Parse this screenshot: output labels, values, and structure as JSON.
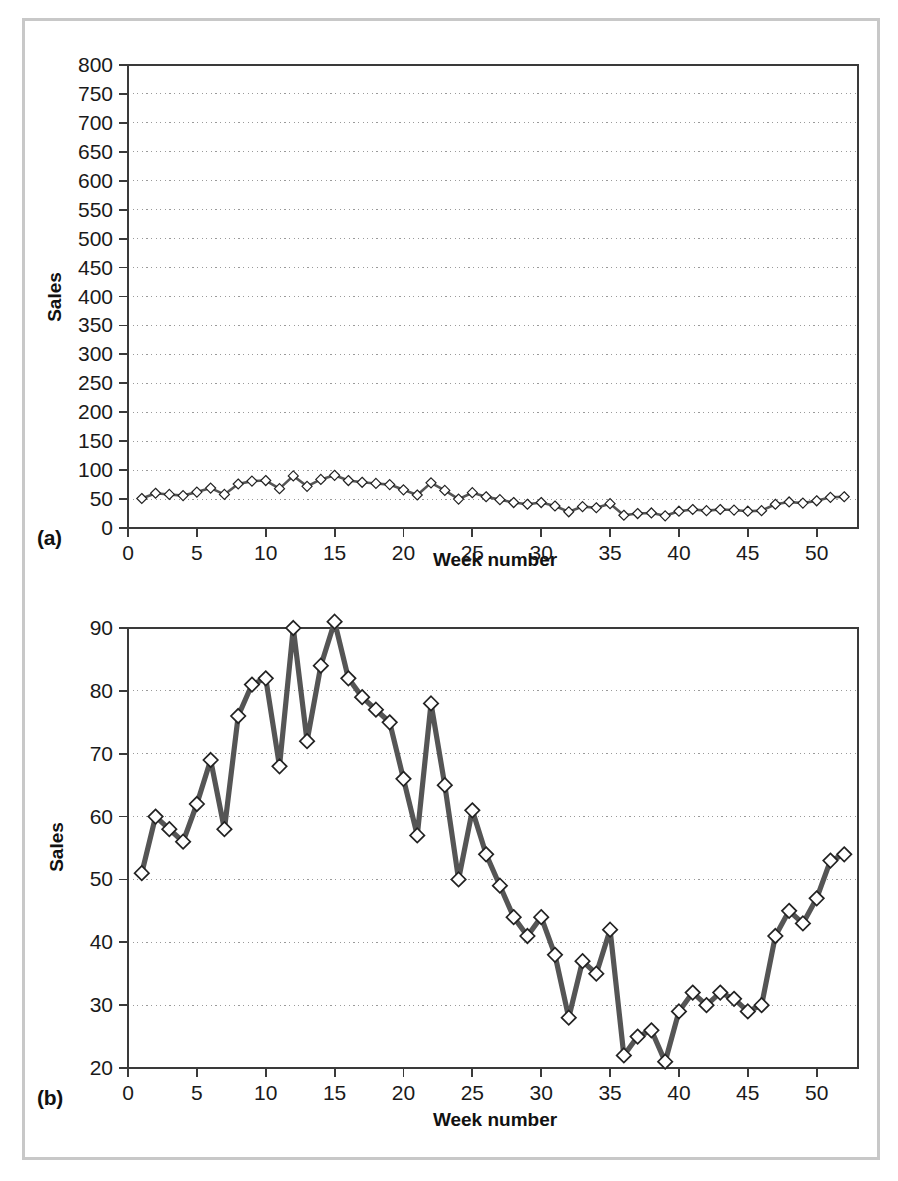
{
  "figure": {
    "border_color": "#c8c8c8",
    "background": "#ffffff"
  },
  "panels": [
    {
      "key": "a",
      "label": "(a)",
      "xlabel": "Week number",
      "ylabel": "Sales"
    },
    {
      "key": "b",
      "label": "(b)",
      "xlabel": "Week number",
      "ylabel": "Sales"
    }
  ],
  "chart_data": [
    {
      "type": "line",
      "panel": "a",
      "title": "",
      "xlabel": "Week number",
      "ylabel": "Sales",
      "xlim": [
        0,
        53
      ],
      "ylim": [
        0,
        800
      ],
      "xticks": [
        0,
        5,
        10,
        15,
        20,
        25,
        30,
        35,
        40,
        45,
        50
      ],
      "yticks": [
        0,
        50,
        100,
        150,
        200,
        250,
        300,
        350,
        400,
        450,
        500,
        550,
        600,
        650,
        700,
        750,
        800
      ],
      "grid": "horizontal-dotted",
      "legend": "none",
      "marker": "diamond-open",
      "line_color": "#555555",
      "marker_fill": "#ffffff",
      "marker_edge": "#222222",
      "x": [
        1,
        2,
        3,
        4,
        5,
        6,
        7,
        8,
        9,
        10,
        11,
        12,
        13,
        14,
        15,
        16,
        17,
        18,
        19,
        20,
        21,
        22,
        23,
        24,
        25,
        26,
        27,
        28,
        29,
        30,
        31,
        32,
        33,
        34,
        35,
        36,
        37,
        38,
        39,
        40,
        41,
        42,
        43,
        44,
        45,
        46,
        47,
        48,
        49,
        50,
        51,
        52
      ],
      "values": [
        51,
        60,
        58,
        56,
        62,
        69,
        58,
        76,
        81,
        82,
        68,
        90,
        72,
        84,
        91,
        82,
        79,
        77,
        75,
        66,
        57,
        78,
        65,
        50,
        61,
        54,
        49,
        44,
        41,
        44,
        38,
        28,
        37,
        35,
        42,
        22,
        25,
        26,
        21,
        29,
        32,
        30,
        32,
        31,
        29,
        30,
        41,
        45,
        43,
        47,
        53,
        54
      ]
    },
    {
      "type": "line",
      "panel": "b",
      "title": "",
      "xlabel": "Week number",
      "ylabel": "Sales",
      "xlim": [
        0,
        53
      ],
      "ylim": [
        20,
        90
      ],
      "xticks": [
        0,
        5,
        10,
        15,
        20,
        25,
        30,
        35,
        40,
        45,
        50
      ],
      "yticks": [
        20,
        30,
        40,
        50,
        60,
        70,
        80,
        90
      ],
      "grid": "horizontal-dotted",
      "legend": "none",
      "marker": "diamond-open",
      "line_color": "#555555",
      "marker_fill": "#ffffff",
      "marker_edge": "#222222",
      "x": [
        1,
        2,
        3,
        4,
        5,
        6,
        7,
        8,
        9,
        10,
        11,
        12,
        13,
        14,
        15,
        16,
        17,
        18,
        19,
        20,
        21,
        22,
        23,
        24,
        25,
        26,
        27,
        28,
        29,
        30,
        31,
        32,
        33,
        34,
        35,
        36,
        37,
        38,
        39,
        40,
        41,
        42,
        43,
        44,
        45,
        46,
        47,
        48,
        49,
        50,
        51,
        52
      ],
      "values": [
        51,
        60,
        58,
        56,
        62,
        69,
        58,
        76,
        81,
        82,
        68,
        90,
        72,
        84,
        91,
        82,
        79,
        77,
        75,
        66,
        57,
        78,
        65,
        50,
        61,
        54,
        49,
        44,
        41,
        44,
        38,
        28,
        37,
        35,
        42,
        22,
        25,
        26,
        21,
        29,
        32,
        30,
        32,
        31,
        29,
        30,
        41,
        45,
        43,
        47,
        53,
        54
      ]
    }
  ]
}
